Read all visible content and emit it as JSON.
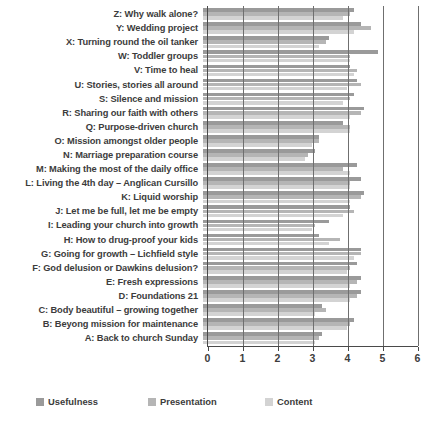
{
  "chart_data": {
    "type": "bar",
    "orientation": "horizontal",
    "title": "",
    "xlabel": "",
    "ylabel": "",
    "xlim": [
      0,
      6
    ],
    "xticks": [
      0,
      1,
      2,
      3,
      4,
      5,
      6
    ],
    "grid": true,
    "legend_position": "bottom",
    "categories": [
      "Z: Why walk alone?",
      "Y: Wedding project",
      "X: Turning round the oil tanker",
      "W: Toddler groups",
      "V: Time to heal",
      "U: Stories, stories all around",
      "S: Silence and mission",
      "R: Sharing our faith with others",
      "Q: Purpose-driven church",
      "O: Mission amongst older people",
      "N: Marriage preparation course",
      "M: Making the most of the daily office",
      "L: Living the 4th day – Anglican Cursillo",
      "K: Liquid worship",
      "J: Let me be full, let me be empty",
      "I: Leading your church into growth",
      "H: How to drug-proof your kids",
      "G: Going for growth – Lichfield style",
      "F: God delusion or Dawkins delusion?",
      "E: Fresh expressions",
      "D: Foundations 21",
      "C: Body beautiful – growing together",
      "B: Beyong mission for maintenance",
      "A: Back to church Sunday"
    ],
    "series": [
      {
        "name": "Usefulness",
        "color": "#9a9a9a",
        "values": [
          4.3,
          4.5,
          3.6,
          5.0,
          4.2,
          4.4,
          4.3,
          4.6,
          4.0,
          3.3,
          3.2,
          4.4,
          4.5,
          4.6,
          4.2,
          3.6,
          3.3,
          4.5,
          4.4,
          4.5,
          4.5,
          3.4,
          4.3,
          3.4
        ]
      },
      {
        "name": "Presentation",
        "color": "#b5b5b5",
        "values": [
          4.2,
          4.8,
          3.5,
          4.2,
          4.4,
          4.5,
          4.2,
          4.5,
          4.2,
          3.3,
          3.0,
          4.0,
          4.2,
          4.5,
          4.3,
          3.2,
          3.9,
          4.5,
          4.2,
          4.4,
          4.4,
          3.5,
          4.2,
          3.3
        ]
      },
      {
        "name": "Content",
        "color": "#d3d3d3",
        "values": [
          4.0,
          4.3,
          3.3,
          4.2,
          4.3,
          4.1,
          4.0,
          4.2,
          4.2,
          3.1,
          2.9,
          4.2,
          4.2,
          4.2,
          4.0,
          3.1,
          3.6,
          4.3,
          4.1,
          4.2,
          4.2,
          3.2,
          4.1,
          3.2
        ]
      }
    ]
  }
}
